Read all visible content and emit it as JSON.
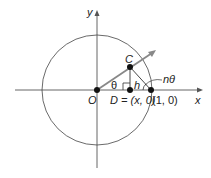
{
  "diagram": {
    "type": "unit-circle-geometry",
    "axes": {
      "x_label": "x",
      "y_label": "y"
    },
    "points": {
      "origin": {
        "label": "O"
      },
      "c": {
        "label": "C"
      },
      "d": {
        "label": "D = (x, 0)",
        "label_prefix": "D = (",
        "label_var": "x",
        "label_suffix": ", 0)"
      },
      "unit": {
        "label": "(1, 0)"
      }
    },
    "angles": {
      "theta": "θ",
      "n_theta": "nθ"
    },
    "segments": {
      "height": "h"
    },
    "colors": {
      "line": "#333333",
      "ray": "#777777",
      "circle": "#444444",
      "point": "#111111"
    }
  }
}
